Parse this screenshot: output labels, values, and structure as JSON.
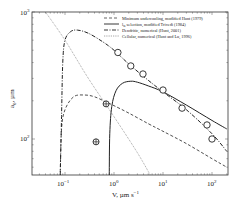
{
  "chart_data": {
    "type": "line",
    "title": "",
    "xlabel": "V, µm s⁻¹",
    "ylabel": "a₀, µm",
    "xscale": "log",
    "yscale": "log",
    "xlim": [
      0.021,
      213
    ],
    "ylim": [
      52,
      1000
    ],
    "grid": false,
    "legend_position": "upper right",
    "x_ticks": [
      {
        "value": 0.1,
        "label": "10⁻¹"
      },
      {
        "value": 1,
        "label": "10⁰"
      },
      {
        "value": 10,
        "label": "10¹"
      },
      {
        "value": 100,
        "label": "10²"
      }
    ],
    "y_ticks": [
      {
        "value": 100,
        "label": "10²"
      },
      {
        "value": 1000,
        "label": "10³"
      }
    ],
    "series": [
      {
        "name": "Minimum undercooling, modified Hunt (1979)",
        "style": "dashed",
        "x": [
          0.08,
          0.085,
          0.1,
          0.15,
          0.25,
          0.4,
          0.7,
          1,
          2,
          5,
          10,
          30,
          100,
          200
        ],
        "y": [
          55,
          120,
          170,
          215,
          222,
          215,
          195,
          183,
          160,
          132,
          115,
          92,
          70,
          60
        ]
      },
      {
        "name": "λ_ss selection, modified Trivedi (1984)",
        "style": "solid",
        "x": [
          0.8,
          0.82,
          0.9,
          1.1,
          1.5,
          2.2,
          3,
          5,
          10,
          30,
          100,
          200
        ],
        "y": [
          52,
          110,
          180,
          240,
          275,
          285,
          280,
          262,
          235,
          185,
          140,
          120
        ]
      },
      {
        "name": "Dendritic, numerical (Hunt, 2001)",
        "style": "dashdot",
        "x": [
          0.08,
          0.085,
          0.09,
          0.1,
          0.13,
          0.18,
          0.3,
          0.6,
          1,
          2,
          5,
          10,
          30,
          100,
          200
        ],
        "y": [
          52,
          150,
          400,
          600,
          700,
          720,
          680,
          580,
          500,
          390,
          290,
          235,
          170,
          110,
          80
        ]
      },
      {
        "name": "Cellular, numerical (Hunt and Lu, 1996)",
        "style": "dotted",
        "x": [
          0.04,
          0.1,
          0.3,
          1,
          3,
          5.5
        ],
        "y": [
          1000,
          600,
          300,
          150,
          78,
          52
        ]
      }
    ],
    "markers": {
      "open_circles": {
        "x": [
          1.2,
          2.2,
          3.9,
          10,
          24.5,
          79,
          100
        ],
        "y": [
          480,
          376,
          325,
          243,
          175,
          129,
          100
        ]
      },
      "crossed_circles": {
        "x": [
          0.69,
          0.43
        ],
        "y": [
          189,
          95
        ]
      }
    },
    "legend": [
      "Minimum undercooling, modified Hunt (1979)",
      "λ_ss selection, modified Trivedi (1984)",
      "Dendritic, numerical (Hunt, 2001)",
      "Cellular, numerical (Hunt and Lu, 1996)"
    ]
  },
  "legend_labels": {
    "l0": "Minimum undercooling, modified Hunt (1979)",
    "l1a": "l",
    "l1sub": "ss",
    "l1b": " selection, modified Trivedi (1984)",
    "l2": "Dendritic, numerical (Hunt, 2001)",
    "l3": "Cellular, numerical (Hunt and Lu, 1996)"
  },
  "axes": {
    "xlabel_main": "V, µm s",
    "xlabel_sup": "−1",
    "ylabel_main": "a",
    "ylabel_sub": "0",
    "ylabel_rest": ", µm",
    "xtick_base": "10",
    "xtick_exps": [
      "−1",
      "0",
      "1",
      "2"
    ],
    "ytick_base": "10",
    "ytick_exps": [
      "2",
      "3"
    ]
  }
}
